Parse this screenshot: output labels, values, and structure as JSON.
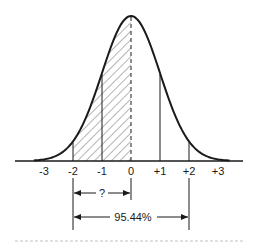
{
  "diagram": {
    "title": "",
    "type": "normal-distribution-curve",
    "axis": {
      "ticks": [
        {
          "value": -3,
          "label": "-3"
        },
        {
          "value": -2,
          "label": "-2"
        },
        {
          "value": -1,
          "label": "-1"
        },
        {
          "value": 0,
          "label": "0"
        },
        {
          "value": 1,
          "label": "+1"
        },
        {
          "value": 2,
          "label": "+2"
        },
        {
          "value": 3,
          "label": "+3"
        }
      ]
    },
    "shaded_region": {
      "from": -2,
      "to": 0,
      "pattern": "diagonal-hatch"
    },
    "vertical_lines": [
      -2,
      -1,
      0,
      1,
      2
    ],
    "dashed_line": 0,
    "annotations": {
      "question": {
        "label": "?",
        "from": -2,
        "to": 0
      },
      "total": {
        "label": "95.44%",
        "from": -2,
        "to": 2
      }
    },
    "colors": {
      "line": "#1a1a1a",
      "background": "#ffffff",
      "footer_dots": "#d8d8d8"
    }
  }
}
